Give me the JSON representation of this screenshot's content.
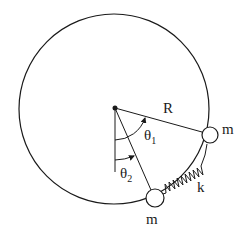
{
  "diagram": {
    "labels": {
      "radius": "R",
      "mass_upper": "m",
      "mass_lower": "m",
      "spring": "k",
      "theta1": "θ",
      "theta1_sub": "1",
      "theta2": "θ",
      "theta2_sub": "2"
    },
    "colors": {
      "stroke": "#1a1a1a",
      "background": "#ffffff"
    }
  }
}
